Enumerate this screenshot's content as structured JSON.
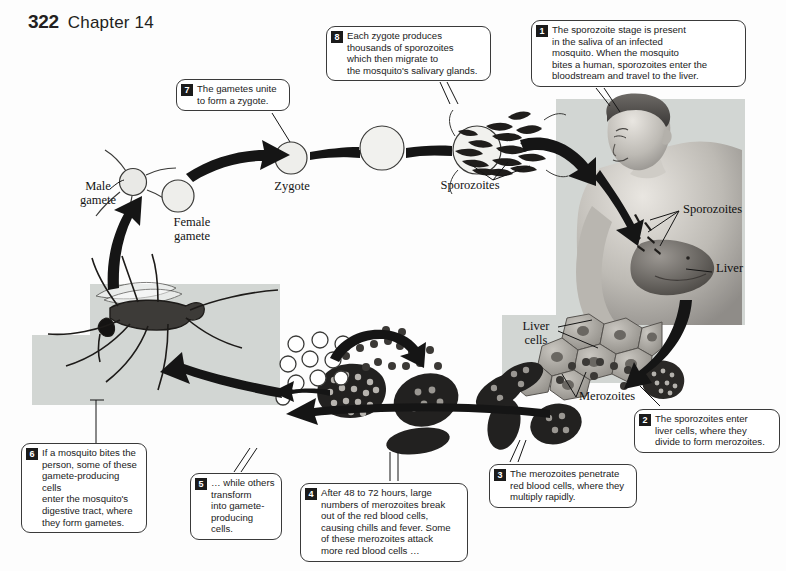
{
  "page": {
    "number": "322",
    "chapter": "Chapter 14"
  },
  "labels": {
    "male_gamete": "Male\ngamete",
    "female_gamete": "Female\ngamete",
    "zygote": "Zygote",
    "sporozoites_arc": "Sporozoites",
    "sporozoites_liver": "Sporozoites",
    "liver": "Liver",
    "liver_cells": "Liver\ncells",
    "merozoites": "Merozoites"
  },
  "callouts": [
    {
      "number": "1",
      "text": "The sporozoite stage is present\nin the saliva of an infected\nmosquito. When the mosquito\nbites a human, sporozoites enter the\nbloodstream and travel to the liver."
    },
    {
      "number": "2",
      "text": "The sporozoites enter\nliver cells, where they\ndivide to form merozoites."
    },
    {
      "number": "3",
      "text": "The merozoites penetrate\nred blood cells, where they\nmultiply rapidly."
    },
    {
      "number": "4",
      "text": "After 48 to 72 hours, large\nnumbers of merozoites break\nout of the red blood cells,\ncausing chills and fever. Some\nof these merozoites attack\nmore red blood cells …"
    },
    {
      "number": "5",
      "text": "… while others\ntransform\ninto gamete-\nproducing cells."
    },
    {
      "number": "6",
      "text": "If a mosquito bites the\nperson, some of these\ngamete-producing cells\nenter the mosquito's\ndigestive tract, where\nthey form gametes."
    },
    {
      "number": "7",
      "text": "The gametes unite\nto form a zygote."
    },
    {
      "number": "8",
      "text": "Each zygote produces\nthousands of sporozoites\nwhich then migrate to\nthe mosquito's salivary glands."
    }
  ],
  "colors": {
    "ink": "#1b1b1b",
    "plate_gray": "#d2d6d3",
    "cell_dark": "#262626",
    "cell_mid": "#8d8d8d",
    "paper": "#ffffff"
  }
}
